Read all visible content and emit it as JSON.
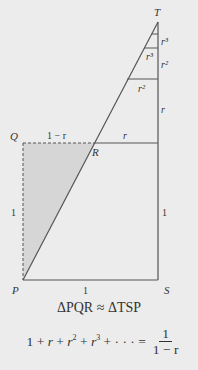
{
  "diagram": {
    "points": {
      "T": {
        "label": "T",
        "x": 158,
        "y": 22
      },
      "Q": {
        "label": "Q",
        "x": 23,
        "y": 143
      },
      "R": {
        "label": "R",
        "x": 95,
        "y": 143
      },
      "P": {
        "label": "P",
        "x": 23,
        "y": 280
      },
      "S": {
        "label": "S",
        "x": 158,
        "y": 280
      }
    },
    "segment_labels": {
      "QR": "1 − r",
      "R_to_right": "r",
      "QP": "1",
      "PS": "1",
      "right_side_lower": "1",
      "right_side_upper": "r",
      "stack_r2_vertical": "r²",
      "stack_r3_vertical": "r³",
      "stack_r2_horizontal": "r²",
      "stack_r3_horizontal": "r³"
    },
    "colors": {
      "background": "#ececec",
      "line": "#555555",
      "shaded_triangle": "#d6d6d6"
    }
  },
  "captions": {
    "similarity": "ΔPQR ≈ ΔTSP",
    "series_lhs_parts": [
      "1",
      "+",
      "r",
      "+",
      "r",
      "2",
      "+",
      "r",
      "3",
      "+",
      "· · ·",
      "="
    ],
    "fraction_numerator": "1",
    "fraction_denominator": "1 − r"
  }
}
